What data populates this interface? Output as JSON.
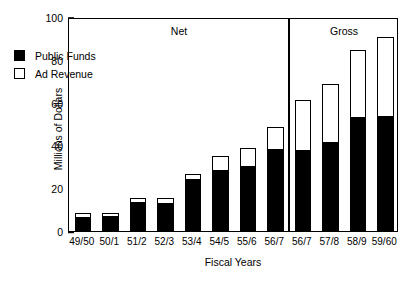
{
  "chart_data": {
    "type": "bar",
    "stacked": true,
    "title": "",
    "xlabel": "Fiscal Years",
    "ylabel": "Millions of Dollars",
    "ylim": [
      0,
      100
    ],
    "yticks": [
      0,
      20,
      40,
      60,
      80,
      100
    ],
    "grid": false,
    "legend_position": "upper-left-inside",
    "categories": [
      "49/50",
      "50/1",
      "51/2",
      "52/3",
      "53/4",
      "54/5",
      "55/6",
      "56/7",
      "56/7",
      "57/8",
      "58/9",
      "59/60"
    ],
    "series": [
      {
        "name": "Public Funds",
        "color": "#000000",
        "values": [
          6.5,
          6.8,
          13.5,
          13.3,
          24.3,
          28.5,
          30.4,
          38.3,
          37.9,
          41.6,
          53.3,
          53.7
        ]
      },
      {
        "name": "Ad Revenue",
        "color": "#ffffff",
        "values": [
          1.9,
          1.7,
          2.0,
          2.2,
          2.3,
          6.5,
          8.4,
          10.3,
          23.3,
          27.1,
          31.3,
          37.0
        ]
      }
    ],
    "totals": [
      8.4,
      8.5,
      15.5,
      15.5,
      26.6,
      35.0,
      38.8,
      48.6,
      61.2,
      68.7,
      84.6,
      90.7
    ],
    "annotations": [
      {
        "text": "Net",
        "group_start": 0,
        "group_end": 7
      },
      {
        "text": "Gross",
        "group_start": 8,
        "group_end": 11
      }
    ],
    "divider_after_category_index": 7
  },
  "axes": {
    "y_tick_labels": [
      "100",
      "80",
      "60",
      "40",
      "20",
      "0"
    ],
    "y_title": "Millions of Dollars",
    "x_title": "Fiscal Years",
    "x_tick_labels": [
      "49/50",
      "50/1",
      "51/2",
      "52/3",
      "53/4",
      "54/5",
      "55/6",
      "56/7",
      "56/7",
      "57/8",
      "58/9",
      "59/60"
    ]
  },
  "groups": {
    "net_label": "Net",
    "gross_label": "Gross"
  },
  "legend": {
    "items": [
      {
        "label": "Public Funds",
        "swatch": "filled-square-icon"
      },
      {
        "label": "Ad Revenue",
        "swatch": "hollow-square-icon"
      }
    ]
  },
  "colors": {
    "public_funds": "#000000",
    "ad_revenue": "#ffffff",
    "stroke": "#000000",
    "background": "#ffffff"
  }
}
